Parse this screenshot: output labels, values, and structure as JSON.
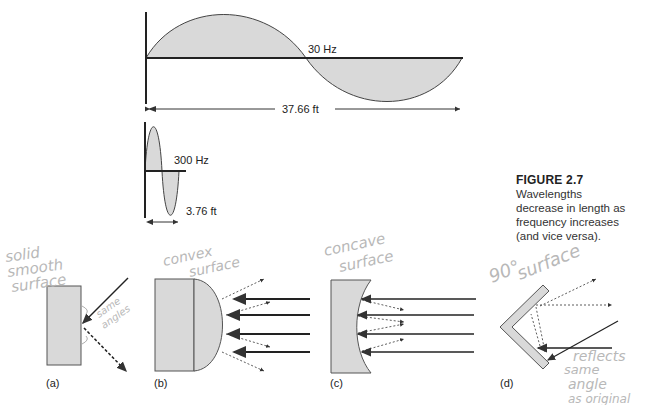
{
  "figure": {
    "number": "FIGURE 2.7",
    "caption_lines": [
      "Wavelengths",
      "decrease in length as",
      "frequency increases",
      "(and vice versa)."
    ]
  },
  "waves": [
    {
      "frequency_label": "30 Hz",
      "wavelength_label": "37.66 ft"
    },
    {
      "frequency_label": "300 Hz",
      "wavelength_label": "3.76 ft"
    }
  ],
  "panels": [
    {
      "id": "a",
      "label": "(a)",
      "annotation_lines": [
        "solid",
        "smooth",
        "surface"
      ],
      "note_lines": [
        "same",
        "angles"
      ]
    },
    {
      "id": "b",
      "label": "(b)",
      "annotation_lines": [
        "convex",
        "surface"
      ]
    },
    {
      "id": "c",
      "label": "(c)",
      "annotation_lines": [
        "concave",
        "surface"
      ]
    },
    {
      "id": "d",
      "label": "(d)",
      "annotation_lines": [
        "90°",
        "surface"
      ],
      "note_lines": [
        "reflects",
        "same",
        "angle",
        "as original"
      ]
    }
  ],
  "colors": {
    "fill": "#d9d9d9",
    "line": "#333333",
    "annotation": "#b8b8b8"
  }
}
